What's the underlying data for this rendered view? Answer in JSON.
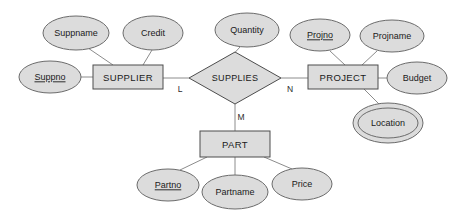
{
  "diagram": {
    "notation": "chen",
    "colors": {
      "shape_fill": "#dcdcdc",
      "shape_stroke": "#4d4d4d",
      "oval_stroke": "#6b6b6b",
      "connector": "#8c8c8c",
      "text": "#1a1a1a",
      "background": "#ffffff"
    },
    "entities": [
      {
        "id": "supplier",
        "label": "SUPPLIER",
        "x": 128,
        "y": 77,
        "w": 70,
        "h": 24
      },
      {
        "id": "project",
        "label": "PROJECT",
        "x": 343,
        "y": 77,
        "w": 70,
        "h": 24
      },
      {
        "id": "part",
        "label": "PART",
        "x": 235,
        "y": 144,
        "w": 70,
        "h": 26
      }
    ],
    "relationships": [
      {
        "id": "supplies",
        "label": "SUPPLIES",
        "x": 235,
        "y": 78,
        "rx": 46,
        "ry": 26
      }
    ],
    "attributes": [
      {
        "id": "suppname",
        "label": "Suppname",
        "owner": "supplier",
        "key": false,
        "multivalued": false,
        "x": 76,
        "y": 33,
        "rx": 33,
        "ry": 17
      },
      {
        "id": "credit",
        "label": "Credit",
        "owner": "supplier",
        "key": false,
        "multivalued": false,
        "x": 153,
        "y": 33,
        "rx": 30,
        "ry": 17
      },
      {
        "id": "suppno",
        "label": "Suppno",
        "owner": "supplier",
        "key": true,
        "multivalued": false,
        "x": 50,
        "y": 77,
        "rx": 31,
        "ry": 16
      },
      {
        "id": "quantity",
        "label": "Quantity",
        "owner": "supplies",
        "key": false,
        "multivalued": false,
        "x": 247,
        "y": 30,
        "rx": 32,
        "ry": 17
      },
      {
        "id": "projno",
        "label": "Projno",
        "owner": "project",
        "key": true,
        "multivalued": false,
        "x": 320,
        "y": 35,
        "rx": 30,
        "ry": 16
      },
      {
        "id": "projname",
        "label": "Projname",
        "owner": "project",
        "key": false,
        "multivalued": false,
        "x": 392,
        "y": 36,
        "rx": 32,
        "ry": 16
      },
      {
        "id": "budget",
        "label": "Budget",
        "owner": "project",
        "key": false,
        "multivalued": false,
        "x": 417,
        "y": 78,
        "rx": 30,
        "ry": 16
      },
      {
        "id": "location",
        "label": "Location",
        "owner": "project",
        "key": false,
        "multivalued": true,
        "x": 388,
        "y": 123,
        "rx": 31,
        "ry": 16
      },
      {
        "id": "partno",
        "label": "Partno",
        "owner": "part",
        "key": true,
        "multivalued": false,
        "x": 168,
        "y": 185,
        "rx": 31,
        "ry": 16
      },
      {
        "id": "partname",
        "label": "Partname",
        "owner": "part",
        "key": false,
        "multivalued": false,
        "x": 235,
        "y": 192,
        "rx": 33,
        "ry": 17
      },
      {
        "id": "price",
        "label": "Price",
        "owner": "part",
        "key": false,
        "multivalued": false,
        "x": 302,
        "y": 184,
        "rx": 30,
        "ry": 16
      }
    ],
    "cardinalities": [
      {
        "id": "card-l",
        "label": "L",
        "x": 180,
        "y": 90
      },
      {
        "id": "card-m",
        "label": "M",
        "x": 241,
        "y": 118
      },
      {
        "id": "card-n",
        "label": "N",
        "x": 290,
        "y": 90
      }
    ],
    "edges": [
      {
        "from": "supplier",
        "to": "supplies",
        "kind": "relationship",
        "cardinality": "L"
      },
      {
        "from": "supplies",
        "to": "project",
        "kind": "relationship",
        "cardinality": "N"
      },
      {
        "from": "supplies",
        "to": "part",
        "kind": "relationship",
        "cardinality": "M"
      }
    ]
  }
}
